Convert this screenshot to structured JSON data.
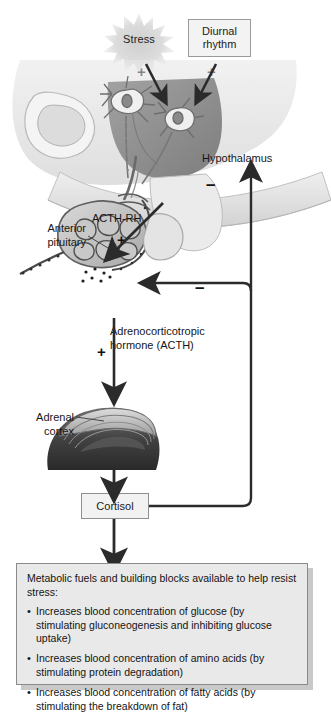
{
  "diagram": {
    "stimuli": {
      "stress_label": "Stress",
      "diurnal_line1": "Diurnal",
      "diurnal_line2": "rhythm",
      "stress_sign": "+",
      "diurnal_sign": "+"
    },
    "anatomy": {
      "hypothalamus_label": "Hypothalamus",
      "anterior_pituitary_label": "Anterior\npituitary",
      "anterior_pituitary_line1": "Anterior",
      "anterior_pituitary_line2": "pituitary",
      "adrenal_cortex_line1": "Adrenal",
      "adrenal_cortex_line2": "cortex"
    },
    "signals": {
      "acth_rh_label": "ACTH-RH",
      "acth_rh_sign": "+",
      "acth_label": "Adrenocorticotropic hormone (ACTH)",
      "acth_sign": "+",
      "cortisol_label": "Cortisol",
      "feedback_hypothalamus_sign": "–",
      "feedback_pituitary_sign": "–"
    },
    "info_box": {
      "heading": "Metabolic fuels and building blocks available to help resist stress:",
      "bullet_char": "•",
      "items": [
        "Increases blood concentration of glucose (by stimulating gluconeogenesis and inhibiting glucose uptake)",
        "Increases blood concentration of amino acids (by stimulating protein degradation)",
        "Increases blood concentration of fatty acids (by stimulating the breakdown of fat)"
      ]
    },
    "colors": {
      "arrow": "#2b2b2b",
      "box_fill": "#e9e9e9",
      "box_border": "#8a8a8a",
      "burst": "#d8d8d8",
      "tissue_light": "#dedede",
      "tissue_mid": "#b4b4b4",
      "tissue_dark": "#6f6f6f",
      "adrenal_dark": "#3c3c3c"
    }
  }
}
